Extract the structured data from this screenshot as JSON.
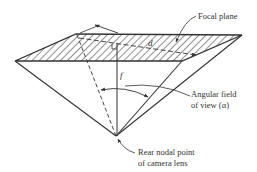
{
  "figure": {
    "labels": {
      "focal_plane": "Focal plane",
      "angular_field_line1": "Angular field",
      "angular_field_line2": "of view (α)",
      "rear_nodal_line1": "Rear nodal point",
      "rear_nodal_line2": "of camera lens",
      "diagonal": "d",
      "focal_length": "f"
    },
    "colors": {
      "stroke": "#333333",
      "hatch": "#333333",
      "background": "#ffffff"
    }
  }
}
